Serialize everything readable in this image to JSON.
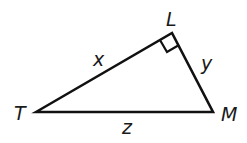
{
  "diagram": {
    "type": "right-triangle",
    "vertices": {
      "T": {
        "label": "T",
        "x": 36,
        "y": 112
      },
      "L": {
        "label": "L",
        "x": 172,
        "y": 33
      },
      "M": {
        "label": "M",
        "x": 213,
        "y": 112
      }
    },
    "sides": {
      "TL": {
        "label": "x"
      },
      "LM": {
        "label": "y"
      },
      "TM": {
        "label": "z"
      }
    },
    "right_angle_at": "L",
    "stroke_color": "#111111"
  }
}
